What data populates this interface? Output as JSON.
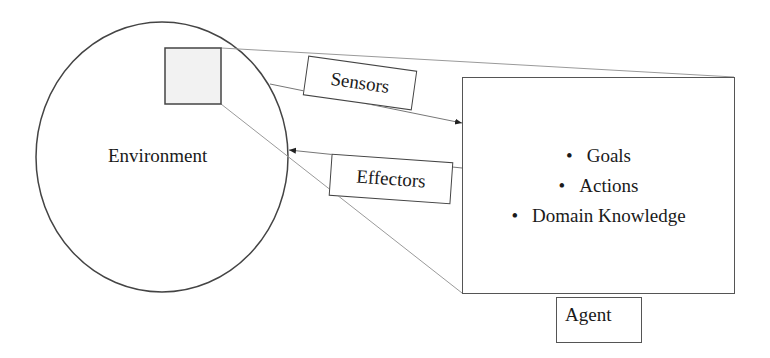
{
  "diagram": {
    "environment": {
      "label": "Environment"
    },
    "sensors": {
      "label": "Sensors"
    },
    "effectors": {
      "label": "Effectors"
    },
    "agent": {
      "label": "Agent",
      "items": [
        "Goals",
        "Actions",
        "Domain Knowledge"
      ]
    },
    "colors": {
      "stroke": "#444444",
      "light_stroke": "#9a9a9a",
      "square_fill": "#f2f2f2",
      "background": "#ffffff"
    }
  }
}
